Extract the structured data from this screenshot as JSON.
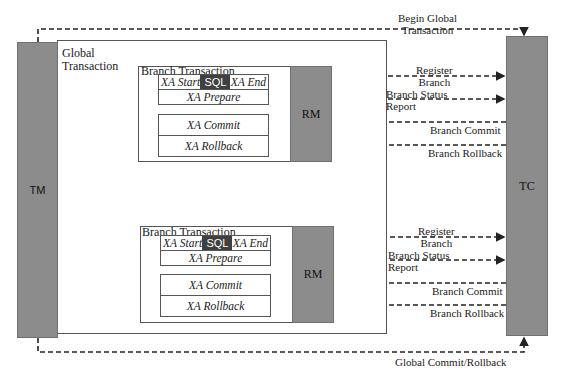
{
  "nodes": {
    "tm": "TM",
    "tc": "TC",
    "rm_1": "RM",
    "rm_2": "RM"
  },
  "global_transaction": {
    "label_line1": "Global",
    "label_line2": "Transaction"
  },
  "branches": [
    {
      "title": "Branch Transaction",
      "xa_start": "XA Start",
      "sql": "SQL",
      "xa_end": "XA End",
      "xa_prepare": "XA Prepare",
      "xa_commit": "XA Commit",
      "xa_rollback": "XA Rollback"
    },
    {
      "title": "Branch Transaction",
      "xa_start": "XA Start",
      "sql": "SQL",
      "xa_end": "XA End",
      "xa_prepare": "XA Prepare",
      "xa_commit": "XA Commit",
      "xa_rollback": "XA Rollback"
    }
  ],
  "edges": {
    "begin_global_line1": "Begin Global",
    "begin_global_line2": "Transaction",
    "global_commit_rollback": "Global Commit/Rollback",
    "branch_1": {
      "register_line1": "Register",
      "register_line2": "Branch",
      "status_line1": "Branch Status",
      "status_line2": "Report",
      "commit": "Branch Commit",
      "rollback": "Branch Rollback"
    },
    "branch_2": {
      "register_line1": "Register",
      "register_line2": "Branch",
      "status_line1": "Branch Status",
      "status_line2": "Report",
      "commit": "Branch Commit",
      "rollback": "Branch Rollback"
    }
  },
  "colors": {
    "node_fill": "#8c8c8c",
    "sql_fill": "#404040",
    "line": "#333333"
  }
}
